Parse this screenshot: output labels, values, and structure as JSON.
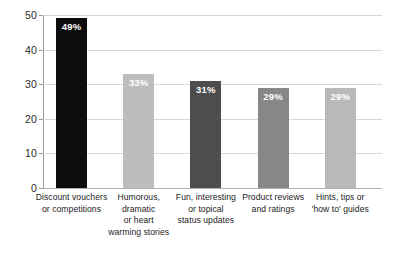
{
  "chart_data": {
    "type": "bar",
    "title": "",
    "subtitle": "",
    "xlabel": "",
    "ylabel": "",
    "ylim": [
      0,
      50
    ],
    "yticks": [
      0,
      10,
      20,
      30,
      40,
      50
    ],
    "ytick_labels": [
      "0",
      "10",
      "20",
      "30",
      "40",
      "50"
    ],
    "grid": true,
    "grid_axis": "y",
    "legend": false,
    "legend_position": "none",
    "categories": [
      "Discount vouchers or competitions",
      "Humorous, dramatic or heart warming stories",
      "Fun, interesting or topical status updates",
      "Product reviews and ratings",
      "Hints, tips or 'how to' guides"
    ],
    "category_lines": [
      [
        "Discount vouchers",
        "or competitions"
      ],
      [
        "Humorous,",
        "dramatic",
        "or heart",
        "warming stories"
      ],
      [
        "Fun, interesting",
        "or topical",
        "status updates"
      ],
      [
        "Product reviews",
        "and ratings"
      ],
      [
        "Hints, tips or",
        "'how to' guides"
      ]
    ],
    "values": [
      49,
      33,
      31,
      29,
      29
    ],
    "data_labels": [
      "49%",
      "33%",
      "31%",
      "29%",
      "29%"
    ],
    "bar_colors": [
      "#0d0d0d",
      "#bdbdbd",
      "#4d4d4d",
      "#878787",
      "#b9b9b9"
    ],
    "data_label_color": "#ffffff"
  },
  "axis": {
    "line_color": "#9a9a9a",
    "grid_color": "#d8d8d8",
    "tick_label_color": "#2b2b2b"
  },
  "canvas": {
    "background": "#ffffff"
  }
}
